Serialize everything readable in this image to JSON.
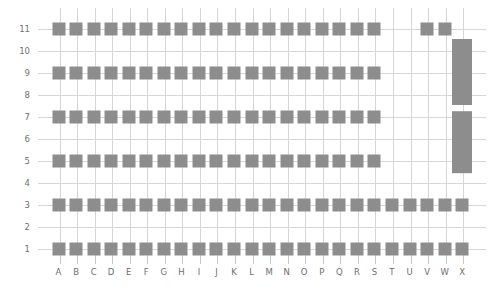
{
  "chart_data": {
    "type": "scatter",
    "title": "",
    "xlabel": "",
    "ylabel": "",
    "x_categories": [
      "A",
      "B",
      "C",
      "D",
      "E",
      "F",
      "G",
      "H",
      "I",
      "J",
      "K",
      "L",
      "M",
      "N",
      "O",
      "P",
      "Q",
      "R",
      "S",
      "T",
      "U",
      "V",
      "W",
      "X"
    ],
    "y_ticks": [
      1,
      2,
      3,
      4,
      5,
      6,
      7,
      8,
      9,
      10,
      11
    ],
    "ylim": [
      0.4,
      11.8
    ],
    "grid": true,
    "legend": "none",
    "marker_shape": "square",
    "marker_color": "#8d8d8d",
    "grid_color": "#d6d6d6",
    "background": "#ffffff",
    "tick_color": "#6f6f6f",
    "series": [
      {
        "name": "row-11",
        "y": 11,
        "x": [
          "A",
          "B",
          "C",
          "D",
          "E",
          "F",
          "G",
          "H",
          "I",
          "J",
          "K",
          "L",
          "M",
          "N",
          "O",
          "P",
          "Q",
          "R",
          "S",
          "V",
          "W"
        ]
      },
      {
        "name": "row-9",
        "y": 9,
        "x": [
          "A",
          "B",
          "C",
          "D",
          "E",
          "F",
          "G",
          "H",
          "I",
          "J",
          "K",
          "L",
          "M",
          "N",
          "O",
          "P",
          "Q",
          "R",
          "S"
        ]
      },
      {
        "name": "row-7",
        "y": 7,
        "x": [
          "A",
          "B",
          "C",
          "D",
          "E",
          "F",
          "G",
          "H",
          "I",
          "J",
          "K",
          "L",
          "M",
          "N",
          "O",
          "P",
          "Q",
          "R",
          "S"
        ]
      },
      {
        "name": "row-5",
        "y": 5,
        "x": [
          "A",
          "B",
          "C",
          "D",
          "E",
          "F",
          "G",
          "H",
          "I",
          "J",
          "K",
          "L",
          "M",
          "N",
          "O",
          "P",
          "Q",
          "R",
          "S"
        ]
      },
      {
        "name": "row-3",
        "y": 3,
        "x": [
          "A",
          "B",
          "C",
          "D",
          "E",
          "F",
          "G",
          "H",
          "I",
          "J",
          "K",
          "L",
          "M",
          "N",
          "O",
          "P",
          "Q",
          "R",
          "S",
          "T",
          "U",
          "V",
          "W",
          "X"
        ]
      },
      {
        "name": "row-1",
        "y": 1,
        "x": [
          "A",
          "B",
          "C",
          "D",
          "E",
          "F",
          "G",
          "H",
          "I",
          "J",
          "K",
          "L",
          "M",
          "N",
          "O",
          "P",
          "Q",
          "R",
          "S",
          "T",
          "U",
          "V",
          "W",
          "X"
        ]
      }
    ],
    "bars": [
      {
        "name": "bar-x-upper",
        "x": "X",
        "y_from": 7.55,
        "y_to": 10.55
      },
      {
        "name": "bar-x-lower",
        "x": "X",
        "y_from": 4.45,
        "y_to": 7.25
      }
    ]
  }
}
